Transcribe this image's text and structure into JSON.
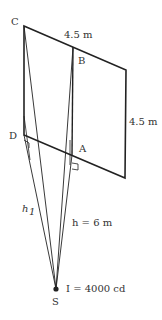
{
  "diagram": {
    "points": {
      "C": "C",
      "B": "B",
      "D": "D",
      "A": "A",
      "S": "S"
    },
    "dimensions": {
      "top_width": "4.5 m",
      "side_height": "4.5 m"
    },
    "labels": {
      "h1_main": "h",
      "h1_sub": "1",
      "h": "h = 6 m",
      "intensity": "I = 4000 cd"
    },
    "colors": {
      "line": "#222222",
      "text": "#333333"
    }
  }
}
